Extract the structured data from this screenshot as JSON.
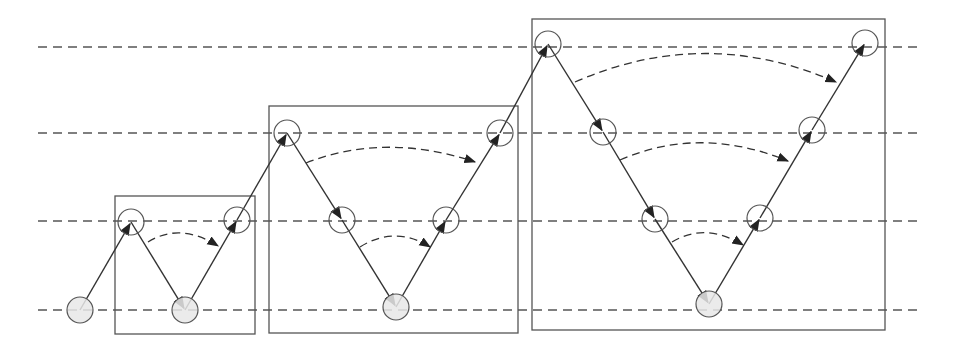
{
  "diagram": {
    "type": "zigzag-level-diagram",
    "colors": {
      "line": "#333333",
      "dash": "#555555",
      "box": "#555555",
      "circle_stroke": "#555555",
      "circle_fill_base": "#e8e8e8",
      "circle_fill_open": "#ffffff"
    },
    "levels_y": [
      47,
      133,
      221,
      310
    ],
    "dash_x_range": [
      38,
      918
    ],
    "boxes": [
      {
        "id": "box-1",
        "x": 115,
        "y": 196,
        "w": 140,
        "h": 138
      },
      {
        "id": "box-2",
        "x": 269,
        "y": 106,
        "w": 249,
        "h": 227
      },
      {
        "id": "box-3",
        "x": 532,
        "y": 19,
        "w": 353,
        "h": 311
      }
    ],
    "nodes": [
      {
        "x": 80,
        "y": 310,
        "base": true
      },
      {
        "x": 131,
        "y": 222,
        "base": false
      },
      {
        "x": 185,
        "y": 310,
        "base": true
      },
      {
        "x": 237,
        "y": 220,
        "base": false
      },
      {
        "x": 287,
        "y": 133,
        "base": false
      },
      {
        "x": 342,
        "y": 220,
        "base": false
      },
      {
        "x": 396,
        "y": 307,
        "base": true
      },
      {
        "x": 446,
        "y": 220,
        "base": false
      },
      {
        "x": 500,
        "y": 133,
        "base": false
      },
      {
        "x": 548,
        "y": 44,
        "base": false
      },
      {
        "x": 603,
        "y": 132,
        "base": false
      },
      {
        "x": 655,
        "y": 219,
        "base": false
      },
      {
        "x": 709,
        "y": 304,
        "base": true
      },
      {
        "x": 760,
        "y": 218,
        "base": false
      },
      {
        "x": 812,
        "y": 130,
        "base": false
      },
      {
        "x": 865,
        "y": 43,
        "base": false
      }
    ],
    "arcs": [
      {
        "from": [
          148,
          242
        ],
        "to": [
          218,
          246
        ],
        "ctrl": [
          180,
          222
        ]
      },
      {
        "from": [
          306,
          163
        ],
        "to": [
          475,
          162
        ],
        "ctrl": [
          385,
          132
        ]
      },
      {
        "from": [
          360,
          247
        ],
        "to": [
          430,
          247
        ],
        "ctrl": [
          395,
          225
        ]
      },
      {
        "from": [
          575,
          82
        ],
        "to": [
          836,
          82
        ],
        "ctrl": [
          705,
          25
        ]
      },
      {
        "from": [
          620,
          160
        ],
        "to": [
          788,
          161
        ],
        "ctrl": [
          700,
          125
        ]
      },
      {
        "from": [
          672,
          242
        ],
        "to": [
          743,
          245
        ],
        "ctrl": [
          705,
          222
        ]
      }
    ],
    "node_radius": 13
  }
}
